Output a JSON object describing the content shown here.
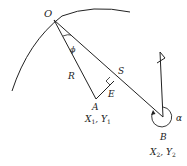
{
  "diagram": {
    "stroke_color": "#222222",
    "background": "#ffffff",
    "points": {
      "O": {
        "label": "O",
        "x": 54,
        "y": 20
      },
      "A": {
        "label": "A",
        "x": 96,
        "y": 99
      },
      "S": {
        "label": "S",
        "x": 114,
        "y": 81
      },
      "B": {
        "label": "B",
        "x": 163,
        "y": 117
      }
    },
    "labels": {
      "O": "O",
      "phi": "ϕ",
      "R": "R",
      "S": "S",
      "E": "E",
      "A": "A",
      "A_coords_x": "X",
      "A_coords_x_sub": "1",
      "A_coords_sep": ", ",
      "A_coords_y": "Y",
      "A_coords_y_sub": "1",
      "B": "B",
      "B_coords_x": "X",
      "B_coords_x_sub": "2",
      "B_coords_sep": ", ",
      "B_coords_y": "Y",
      "B_coords_y_sub": "2",
      "alpha": "α"
    }
  }
}
